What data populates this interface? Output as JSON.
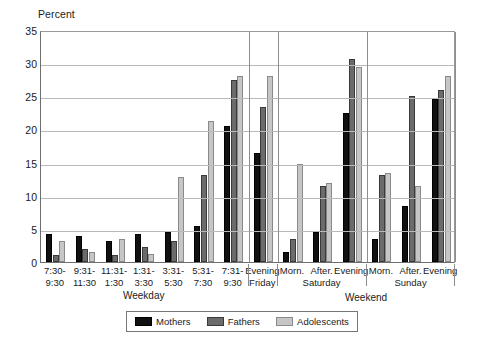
{
  "chart_data": {
    "type": "bar",
    "title": "",
    "ylabel": "Percent",
    "xlabel": "",
    "ylim": [
      0,
      35
    ],
    "ytick_step": 5,
    "yticks": [
      "35",
      "30",
      "25",
      "20",
      "15",
      "10",
      "5",
      "0"
    ],
    "grid": true,
    "legend_position": "bottom",
    "categories": [
      "7:30-\n9:30",
      "9:31-\n11:30",
      "11:31-\n1:30",
      "1:31-\n3:30",
      "3:31-\n5:30",
      "5:31-\n7:30",
      "7:31-\n9:30",
      "Evening",
      "Morn.",
      "After.",
      "Evening",
      "Morn.",
      "After.",
      "Evening"
    ],
    "series": [
      {
        "name": "Mothers",
        "color": "#111111",
        "values": [
          4.3,
          3.9,
          3.1,
          4.2,
          4.6,
          5.5,
          20.5,
          16.5,
          1.5,
          4.5,
          22.5,
          3.5,
          8.4,
          24.6
        ]
      },
      {
        "name": "Fathers",
        "color": "#6b6b6b",
        "values": [
          1.0,
          2.0,
          1.1,
          2.2,
          3.1,
          13.1,
          27.5,
          23.4,
          3.5,
          11.5,
          30.6,
          13.1,
          25.0,
          26.0
        ]
      },
      {
        "name": "Adolescents",
        "color": "#c6c6c6",
        "values": [
          3.1,
          1.5,
          3.5,
          1.2,
          12.9,
          21.2,
          28.0,
          28.0,
          14.8,
          11.9,
          29.4,
          13.4,
          11.4,
          28.0
        ]
      }
    ],
    "tick_labels": [
      {
        "line1": "7:30-",
        "line2": "9:30"
      },
      {
        "line1": "9:31-",
        "line2": "11:30"
      },
      {
        "line1": "11:31-",
        "line2": "1:30"
      },
      {
        "line1": "1:31-",
        "line2": "3:30"
      },
      {
        "line1": "3:31-",
        "line2": "5:30"
      },
      {
        "line1": "5:31-",
        "line2": "7:30"
      },
      {
        "line1": "7:31-",
        "line2": "9:30"
      },
      {
        "line1": "Evening",
        "line2": ""
      },
      {
        "line1": "Morn.",
        "line2": ""
      },
      {
        "line1": "After.",
        "line2": ""
      },
      {
        "line1": "Evening",
        "line2": ""
      },
      {
        "line1": "Morn.",
        "line2": ""
      },
      {
        "line1": "After.",
        "line2": ""
      },
      {
        "line1": "Evening",
        "line2": ""
      }
    ],
    "day_labels": [
      "Friday",
      "Saturday",
      "Sunday"
    ],
    "section_labels": [
      "Weekday",
      "Weekend"
    ],
    "legend_entries": [
      "Mothers",
      "Fathers",
      "Adolescents"
    ]
  },
  "axis": {
    "y_title": "Percent",
    "yticks": [
      "35",
      "30",
      "25",
      "20",
      "15",
      "10",
      "5",
      "0"
    ]
  },
  "sections": {
    "weekday": "Weekday",
    "weekend": "Weekend"
  },
  "days": {
    "friday": "Friday",
    "saturday": "Saturday",
    "sunday": "Sunday"
  },
  "legend": {
    "mothers": "Mothers",
    "fathers": "Fathers",
    "adolescents": "Adolescents"
  }
}
